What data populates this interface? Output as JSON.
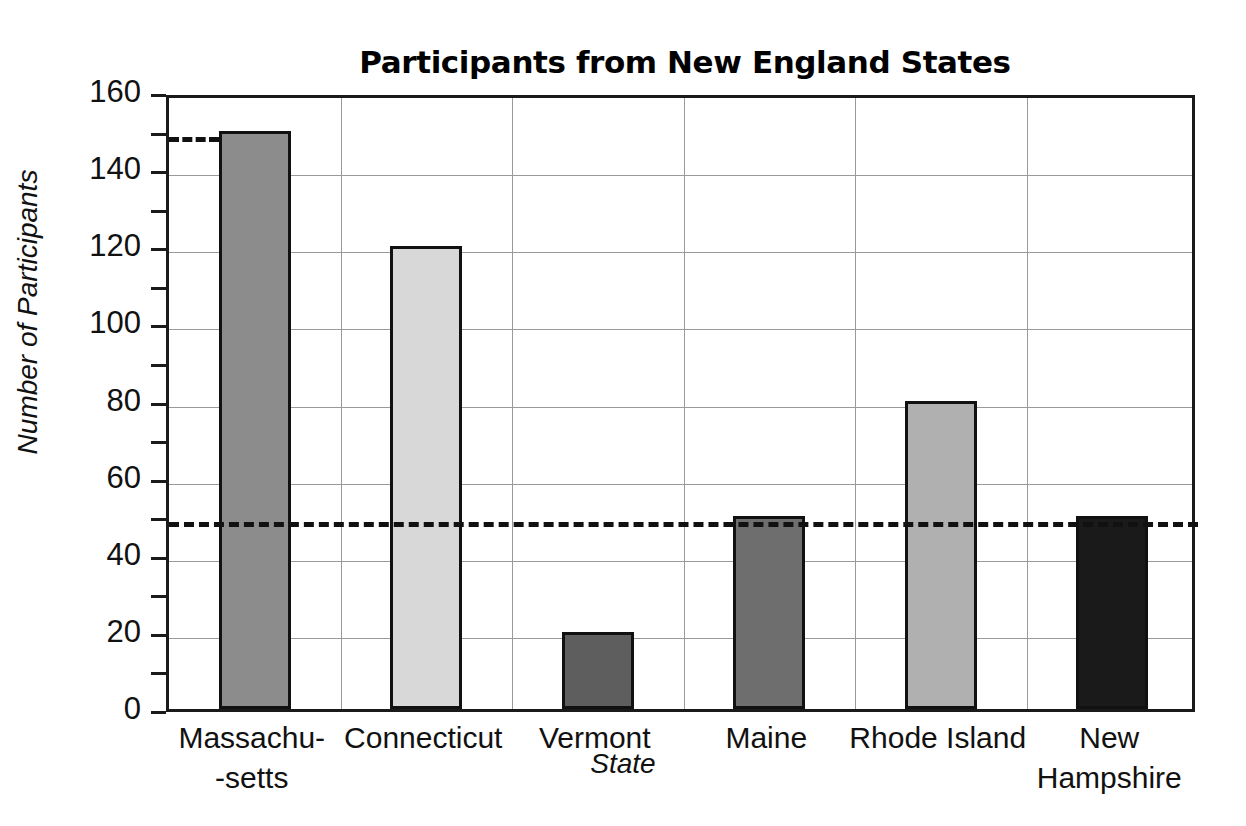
{
  "chart_data": {
    "type": "bar",
    "title": "Participants from New England States",
    "xlabel": "State",
    "ylabel": "Number of Participants",
    "categories": [
      "Massachu--setts",
      "Connecticut",
      "Vermont",
      "Maine",
      "Rhode Island",
      "New Hampshire"
    ],
    "category_lines": [
      [
        "Massachu-",
        "-setts"
      ],
      [
        "Connecticut"
      ],
      [
        "Vermont"
      ],
      [
        "Maine"
      ],
      [
        "Rhode Island"
      ],
      [
        "New",
        "Hampshire"
      ]
    ],
    "values": [
      150,
      120,
      20,
      50,
      80,
      50
    ],
    "bar_colors": [
      "#8c8c8c",
      "#d8d8d8",
      "#5e5e5e",
      "#6e6e6e",
      "#b0b0b0",
      "#1a1a1a"
    ],
    "ylim": [
      0,
      160
    ],
    "ytick_step": 20,
    "yminor_step": 10,
    "ytick_labels": [
      "0",
      "20",
      "40",
      "60",
      "80",
      "100",
      "120",
      "140",
      "160"
    ],
    "ytick_values": [
      0,
      20,
      40,
      60,
      80,
      100,
      120,
      140,
      160
    ],
    "grid": "horizontal-and-vertical",
    "legend": "none",
    "annotations": [
      {
        "name": "reference-line-50",
        "value": 50,
        "style": "dashed",
        "extent": "full-width"
      },
      {
        "name": "reference-line-150",
        "value": 150,
        "style": "dashed",
        "extent": "axis-to-first-bar"
      }
    ],
    "axis_line_color": "#1a1a1a",
    "grid_color": "#9a9a9a"
  }
}
